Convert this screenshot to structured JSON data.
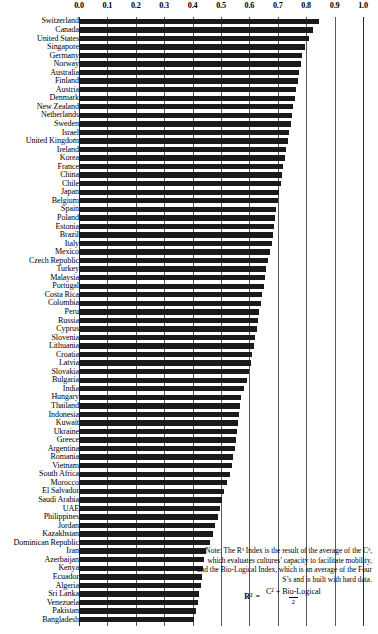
{
  "chart_data": {
    "type": "bar",
    "orientation": "horizontal",
    "title": "",
    "subtitle": "",
    "xlabel": "",
    "ylabel": "",
    "xlim": [
      0.0,
      1.0
    ],
    "grid": true,
    "legend": false,
    "legend_position": "none",
    "axis_ticks": [
      "0.0",
      "0.1",
      "0.2",
      "0.3",
      "0.4",
      "0.5",
      "0.6",
      "0.7",
      "0.8",
      "0.9",
      "1.0"
    ],
    "axis_tick_values": [
      0.0,
      0.1,
      0.2,
      0.3,
      0.4,
      0.5,
      0.6,
      0.7,
      0.8,
      0.9,
      1.0
    ],
    "bar_color": "#1a1a1a",
    "categories": [
      "Switzerland",
      "Canada",
      "United States",
      "Singapore",
      "Germany",
      "Norway",
      "Australia",
      "Finland",
      "Austria",
      "Denmark",
      "New Zealand",
      "Netherlands",
      "Sweden",
      "Israel",
      "United Kingdom",
      "Ireland",
      "Korea",
      "France",
      "China",
      "Chile",
      "Japan",
      "Belgium",
      "Spain",
      "Poland",
      "Estonia",
      "Brazil",
      "Italy",
      "Mexico",
      "Czech Republic",
      "Turkey",
      "Malaysia",
      "Portugal",
      "Costa Rica",
      "Colombia",
      "Peru",
      "Russia",
      "Cyprus",
      "Slovenia",
      "Lithuania",
      "Croatia",
      "Latvia",
      "Slovakia",
      "Bulgaria",
      "India",
      "Hungary",
      "Thailand",
      "Indonesia",
      "Kuwait",
      "Ukraine",
      "Greece",
      "Argentina",
      "Romania",
      "Vietnam",
      "South Africa",
      "Morocco",
      "El Salvador",
      "Saudi Arabia",
      "UAE",
      "Philippines",
      "Jordan",
      "Kazakhstan",
      "Dominican Republic",
      "Iran",
      "Azerbaijan",
      "Kenya",
      "Ecuador",
      "Algeria",
      "Sri Lanka",
      "Venezuela",
      "Pakistan",
      "Bangladesh"
    ],
    "values": [
      0.845,
      0.825,
      0.81,
      0.795,
      0.785,
      0.78,
      0.775,
      0.77,
      0.765,
      0.76,
      0.755,
      0.75,
      0.745,
      0.74,
      0.735,
      0.73,
      0.725,
      0.72,
      0.715,
      0.71,
      0.705,
      0.7,
      0.695,
      0.69,
      0.685,
      0.682,
      0.678,
      0.672,
      0.665,
      0.66,
      0.655,
      0.65,
      0.645,
      0.64,
      0.635,
      0.63,
      0.625,
      0.62,
      0.615,
      0.61,
      0.605,
      0.6,
      0.59,
      0.582,
      0.572,
      0.568,
      0.564,
      0.56,
      0.556,
      0.552,
      0.548,
      0.544,
      0.538,
      0.532,
      0.52,
      0.512,
      0.505,
      0.498,
      0.488,
      0.48,
      0.472,
      0.462,
      0.448,
      0.44,
      0.436,
      0.432,
      0.428,
      0.424,
      0.418,
      0.412,
      0.405
    ]
  },
  "note": {
    "text": "Note: The R² Index is the result of the average of the C², which evaluates cultures’ capacity to facilitate mobility, and the Bio-Logical Index, which is an average of the Four S’s and is built with hard data.",
    "formula_lhs": "R²",
    "formula_equals": "=",
    "formula_numerator": "C² + Bio-Logical",
    "formula_denominator": "2"
  }
}
